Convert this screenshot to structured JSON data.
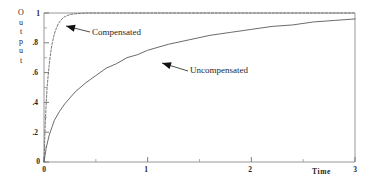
{
  "chart_data": {
    "type": "line",
    "title": "",
    "xlabel": "Time",
    "ylabel": "Output",
    "ylabel_letters": [
      "O",
      "u",
      "t",
      "p",
      "u",
      "t"
    ],
    "xlim": [
      0,
      3
    ],
    "ylim": [
      0,
      1
    ],
    "grid": false,
    "legend_position": "inline-annotations",
    "xticks": [
      0,
      1,
      2,
      3
    ],
    "xtick_labels": [
      "0",
      "1",
      "2",
      "3"
    ],
    "xminor_ticks": [
      0.5,
      1.5,
      2.5
    ],
    "yticks": [
      0,
      0.2,
      0.4,
      0.6,
      0.8,
      1
    ],
    "ytick_labels": [
      "0",
      ".2",
      ".4",
      ".6",
      ".8",
      "1"
    ],
    "yminor_ticks": [
      0.1,
      0.3,
      0.5,
      0.7,
      0.9
    ],
    "series": [
      {
        "name": "Compensated",
        "style": "dashed",
        "color": "#6a6a6a",
        "x": [
          0,
          0.01,
          0.02,
          0.03,
          0.04,
          0.05,
          0.06,
          0.07,
          0.08,
          0.09,
          0.1,
          0.12,
          0.14,
          0.16,
          0.18,
          0.2,
          0.25,
          0.3,
          0.4,
          0.5,
          0.75,
          1.0,
          1.5,
          2.0,
          2.5,
          3.0
        ],
        "y": [
          0,
          0.22,
          0.38,
          0.5,
          0.58,
          0.65,
          0.71,
          0.76,
          0.8,
          0.83,
          0.86,
          0.9,
          0.93,
          0.95,
          0.965,
          0.975,
          0.99,
          0.995,
          1.0,
          1.0,
          1.0,
          1.0,
          1.0,
          1.0,
          1.0,
          1.0
        ]
      },
      {
        "name": "Uncompensated",
        "style": "solid",
        "color": "#5a5a5a",
        "x": [
          0,
          0.02,
          0.05,
          0.08,
          0.1,
          0.15,
          0.2,
          0.25,
          0.3,
          0.4,
          0.5,
          0.6,
          0.7,
          0.8,
          0.9,
          1.0,
          1.2,
          1.4,
          1.6,
          1.8,
          2.0,
          2.2,
          2.4,
          2.6,
          2.8,
          3.0
        ],
        "y": [
          0,
          0.09,
          0.18,
          0.24,
          0.28,
          0.34,
          0.39,
          0.43,
          0.47,
          0.53,
          0.58,
          0.63,
          0.66,
          0.7,
          0.72,
          0.75,
          0.79,
          0.82,
          0.85,
          0.87,
          0.89,
          0.91,
          0.92,
          0.94,
          0.95,
          0.96
        ]
      }
    ],
    "annotations": [
      {
        "label": "Compensated",
        "text_x": 92,
        "text_y": 27,
        "arrow_tip_x": 66,
        "arrow_tip_y": 26,
        "arrow_tail_x": 90,
        "arrow_tail_y": 32
      },
      {
        "label": "Uncompensated",
        "text_x": 190,
        "text_y": 65,
        "arrow_tip_x": 162,
        "arrow_tip_y": 63,
        "arrow_tail_x": 188,
        "arrow_tail_y": 71
      }
    ]
  },
  "axis_colors": {
    "frame": "#8c8c8c",
    "tick": "#6f6f6f",
    "text": "#1f1f1f",
    "background": "#ffffff"
  }
}
